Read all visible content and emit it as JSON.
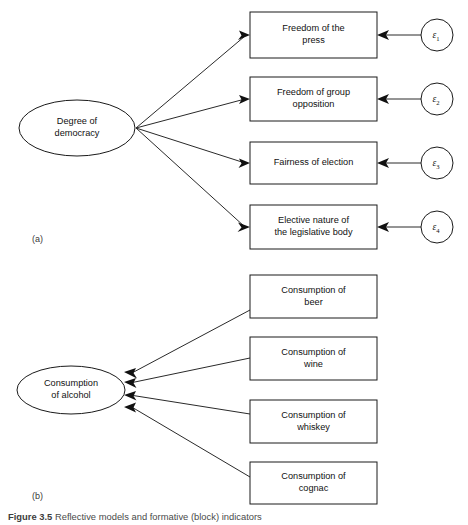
{
  "figure": {
    "caption_prefix": "Figure 3.5",
    "caption_body": "Reflective models and formative (block) indicators",
    "panel_a_label": "(a)",
    "panel_b_label": "(b)"
  },
  "colors": {
    "background": "#ffffff",
    "stroke": "#1a1a1a",
    "connector": "#2a2a2a",
    "text": "#111111",
    "caption": "#4a4a4a"
  },
  "panel_a": {
    "construct": {
      "line1": "Degree of",
      "line2": "democracy"
    },
    "indicators": [
      {
        "line1": "Freedom of the",
        "line2": "press"
      },
      {
        "line1": "Freedom of group",
        "line2": "opposition"
      },
      {
        "line1": "Fairness of election",
        "line2": ""
      },
      {
        "line1": "Elective nature of",
        "line2": "the legislative body"
      }
    ],
    "errors": [
      {
        "symbol": "ε",
        "subscript": "1"
      },
      {
        "symbol": "ε",
        "subscript": "2"
      },
      {
        "symbol": "ε",
        "subscript": "3"
      },
      {
        "symbol": "ε",
        "subscript": "4"
      }
    ]
  },
  "panel_b": {
    "construct": {
      "line1": "Consumption",
      "line2": "of alcohol"
    },
    "indicators": [
      {
        "line1": "Consumption of",
        "line2": "beer"
      },
      {
        "line1": "Consumption of",
        "line2": "wine"
      },
      {
        "line1": "Consumption of",
        "line2": "whiskey"
      },
      {
        "line1": "Consumption of",
        "line2": "cognac"
      }
    ]
  }
}
